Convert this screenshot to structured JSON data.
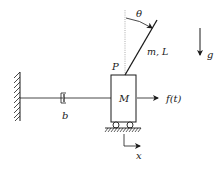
{
  "diagram": {
    "type": "inverted-pendulum-on-cart",
    "labels": {
      "theta": "θ",
      "rod": "m, L",
      "pivot": "P",
      "cart_mass": "M",
      "force": "f(t)",
      "damper": "b",
      "displacement": "x",
      "gravity": "g"
    },
    "colors": {
      "stroke": "#1a1a1a",
      "background": "#ffffff",
      "dotted_reference": "#888888"
    }
  }
}
